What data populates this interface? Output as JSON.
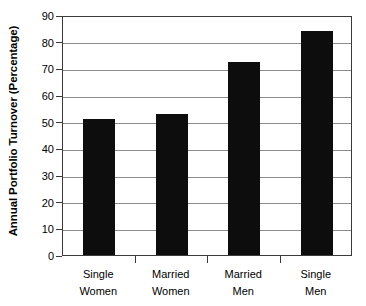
{
  "chart_data": {
    "type": "bar",
    "title": "",
    "subtitle": "",
    "xlabel": "",
    "ylabel": "Annual Portfolio Turnover (Percentage)",
    "categories": [
      "Single Women",
      "Married Women",
      "Married Men",
      "Single Men"
    ],
    "category_lines": [
      [
        "Single",
        "Women"
      ],
      [
        "Married",
        "Women"
      ],
      [
        "Married",
        "Men"
      ],
      [
        "Single",
        "Men"
      ]
    ],
    "values": [
      51,
      53,
      72.5,
      84
    ],
    "ylim": [
      0,
      90
    ],
    "ytick_step": 10,
    "yticks": [
      0,
      10,
      20,
      30,
      40,
      50,
      60,
      70,
      80,
      90
    ],
    "ytick_labels": [
      "0",
      "10",
      "20",
      "30",
      "40",
      "50",
      "60",
      "70",
      "80",
      "90"
    ],
    "grid": true,
    "grid_axis": "y",
    "legend": false,
    "legend_position": "none",
    "bar_color": "#0d0d0d",
    "grid_color": "#8c8c8c",
    "axis_color": "#3a3a3a",
    "background_color": "#ffffff"
  }
}
